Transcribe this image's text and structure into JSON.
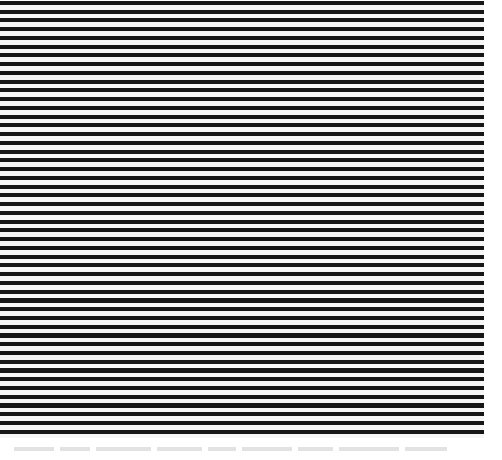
{
  "pattern": {
    "type": "horizontal-stripes",
    "stripe_color": "#161616",
    "background_color": "#f6f6f6",
    "period_px": 8.75,
    "stripe_thickness_px": 4,
    "stripe_count": 50
  },
  "footer": {
    "text": ""
  }
}
